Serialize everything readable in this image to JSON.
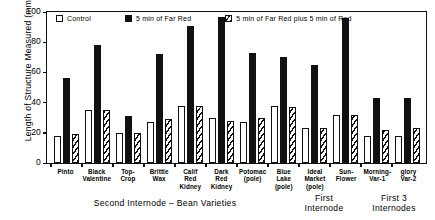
{
  "chart_data": {
    "type": "bar",
    "title": "",
    "xlabel": "Second Internode - Bean Varieties",
    "ylabel": "Length of Structure Measured (mm)",
    "ylim": [
      0,
      100
    ],
    "yticks": [
      0,
      20,
      40,
      60,
      80,
      100
    ],
    "grid": false,
    "legend_position": "top-inside",
    "categories": [
      "Pinto",
      "Black Valentine",
      "Top- Crop",
      "Brittle Wax",
      "Calif Red Kidney",
      "Dark Red Kidney",
      "Potomac (pole)",
      "Blue Lake (pole)",
      "Ideal Market (pole)",
      "Sun- Flower",
      "Morning-glory Var-1",
      "Morning-glory Var-2"
    ],
    "series": [
      {
        "name": "Control",
        "values": [
          18,
          35,
          20,
          27,
          38,
          30,
          27,
          38,
          23,
          32,
          18,
          18
        ]
      },
      {
        "name": "5 min of Far Red",
        "values": [
          56,
          78,
          31,
          72,
          91,
          97,
          73,
          70,
          65,
          96,
          43,
          43
        ]
      },
      {
        "name": "5 min of Far Red plus 5 min of Red",
        "values": [
          19,
          35,
          20,
          29,
          38,
          28,
          30,
          37,
          23,
          32,
          22,
          23
        ]
      }
    ],
    "section_captions": [
      "Second  Internode - Bean  Varieties",
      "First Internode",
      "First 3 Internodes"
    ]
  },
  "axis": {
    "y_title": "Length of Structure Measured (mm)",
    "y_ticks": [
      "100",
      "80",
      "60",
      "40",
      "20",
      "0"
    ]
  },
  "categories": [
    {
      "lines": [
        "Pinto"
      ]
    },
    {
      "lines": [
        "Black",
        "Valentine"
      ]
    },
    {
      "lines": [
        "Top-",
        "Crop"
      ]
    },
    {
      "lines": [
        "Brittle",
        "Wax"
      ]
    },
    {
      "lines": [
        "Calif",
        "Red",
        "Kidney"
      ]
    },
    {
      "lines": [
        "Dark",
        "Red",
        "Kidney"
      ]
    },
    {
      "lines": [
        "Potomac",
        "(pole)"
      ]
    },
    {
      "lines": [
        "Blue",
        "Lake",
        "(pole)"
      ]
    },
    {
      "lines": [
        "Ideal",
        "Market",
        "(pole)"
      ]
    },
    {
      "lines": [
        "Sun-",
        "Flower"
      ]
    },
    {
      "lines": [
        "Morning-",
        "Var-1"
      ]
    },
    {
      "lines": [
        "glory",
        "Var-2"
      ]
    }
  ],
  "legend": {
    "items": [
      {
        "label": "Control",
        "swatch": "control-swatch"
      },
      {
        "label": "5 min of Far Red",
        "swatch": "far-red-swatch"
      },
      {
        "label": "5 min of Far Red plus 5 min of Red",
        "swatch": "far-red-plus-red-swatch"
      }
    ]
  },
  "captions": {
    "second_internode": "Second  Internode – Bean  Varieties",
    "first_internode": "First Internode",
    "first_3_internodes": "First 3 Internodes"
  }
}
